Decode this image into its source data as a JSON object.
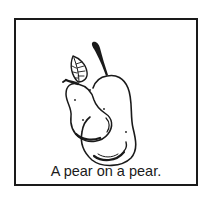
{
  "card": {
    "caption": "A pear on a pear.",
    "illustration": {
      "subject": "pear-on-pear",
      "description": "Line drawing of a small pear with leaf resting on a larger pear"
    }
  },
  "colors": {
    "ink": "#1a1a1a",
    "background": "#ffffff"
  }
}
